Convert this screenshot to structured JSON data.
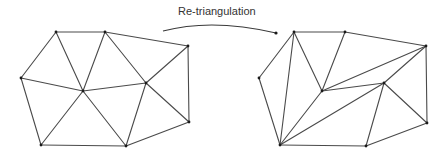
{
  "title": "Re-triangulation",
  "colors": {
    "edge": "#4a4a4a",
    "vertex": "#1a1a1a",
    "text": "#333333",
    "background": "#ffffff"
  },
  "arrow": {
    "label": "Re-triangulation",
    "label_pos": [
      178,
      6
    ],
    "path": "M163,31 Q212,18 276,33",
    "tip": [
      276,
      33
    ]
  },
  "meshes": [
    {
      "name": "original-mesh",
      "vertices": {
        "A": [
          56,
          32
        ],
        "B": [
          105,
          32
        ],
        "C": [
          188,
          46
        ],
        "D": [
          21,
          78
        ],
        "E": [
          83,
          91
        ],
        "F": [
          146,
          83
        ],
        "G": [
          189,
          122
        ],
        "H": [
          41,
          145
        ],
        "I": [
          126,
          146
        ]
      },
      "edges": [
        [
          "A",
          "B"
        ],
        [
          "B",
          "C"
        ],
        [
          "C",
          "G"
        ],
        [
          "G",
          "I"
        ],
        [
          "I",
          "H"
        ],
        [
          "H",
          "D"
        ],
        [
          "D",
          "A"
        ],
        [
          "A",
          "E"
        ],
        [
          "B",
          "E"
        ],
        [
          "D",
          "E"
        ],
        [
          "E",
          "F"
        ],
        [
          "B",
          "F"
        ],
        [
          "C",
          "F"
        ],
        [
          "F",
          "G"
        ],
        [
          "F",
          "I"
        ],
        [
          "E",
          "H"
        ],
        [
          "E",
          "I"
        ]
      ]
    },
    {
      "name": "retriangulated-mesh",
      "vertices": {
        "A": [
          294,
          32
        ],
        "B": [
          345,
          32
        ],
        "C": [
          426,
          46
        ],
        "D": [
          259,
          78
        ],
        "E": [
          322,
          91
        ],
        "F": [
          384,
          83
        ],
        "G": [
          427,
          123
        ],
        "H": [
          280,
          145
        ],
        "I": [
          366,
          146
        ]
      },
      "edges": [
        [
          "A",
          "B"
        ],
        [
          "B",
          "C"
        ],
        [
          "C",
          "G"
        ],
        [
          "G",
          "I"
        ],
        [
          "I",
          "H"
        ],
        [
          "H",
          "D"
        ],
        [
          "D",
          "A"
        ],
        [
          "A",
          "H"
        ],
        [
          "A",
          "E"
        ],
        [
          "B",
          "E"
        ],
        [
          "E",
          "H"
        ],
        [
          "E",
          "C"
        ],
        [
          "E",
          "F"
        ],
        [
          "F",
          "C"
        ],
        [
          "F",
          "H"
        ],
        [
          "F",
          "I"
        ],
        [
          "F",
          "G"
        ]
      ]
    }
  ]
}
